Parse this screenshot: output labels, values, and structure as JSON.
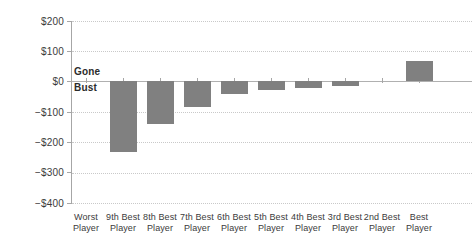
{
  "chart_data": {
    "type": "bar",
    "title": "",
    "subtitle": "",
    "xlabel": "",
    "ylabel": "",
    "categories": [
      "Worst Player",
      "9th Best Player",
      "8th Best Player",
      "7th Best Player",
      "6th Best Player",
      "5th Best Player",
      "4th Best Player",
      "3rd Best Player",
      "2nd Best Player",
      "Best Player"
    ],
    "category_lines": [
      [
        "Worst",
        "Player"
      ],
      [
        "9th Best",
        "Player"
      ],
      [
        "8th Best",
        "Player"
      ],
      [
        "7th Best",
        "Player"
      ],
      [
        "6th Best",
        "Player"
      ],
      [
        "5th Best",
        "Player"
      ],
      [
        "4th Best",
        "Player"
      ],
      [
        "3rd Best",
        "Player"
      ],
      [
        "2nd Best",
        "Player"
      ],
      [
        "Best",
        "Player"
      ]
    ],
    "values": [
      0,
      -234,
      -143,
      -86,
      -43,
      -30,
      -23,
      -16,
      0,
      65
    ],
    "ylim": [
      -400,
      200
    ],
    "ytick_values": [
      200,
      100,
      0,
      -100,
      -200,
      -300,
      -400
    ],
    "ytick_labels": [
      "$200",
      "$100",
      "$0",
      "−$100",
      "−$200",
      "−$300",
      "−$400"
    ],
    "grid": true,
    "legend": null,
    "bar_color": "#808080",
    "gridline_color": "#c9c9c9",
    "zero_line_color": "#b0b0b0",
    "axis_color": "#a6a6a6",
    "text_color": "#3b3b3b",
    "annotations": [
      {
        "text": "Gone",
        "position": "above-zero-line"
      },
      {
        "text": "Bust",
        "position": "below-zero-line"
      }
    ]
  }
}
